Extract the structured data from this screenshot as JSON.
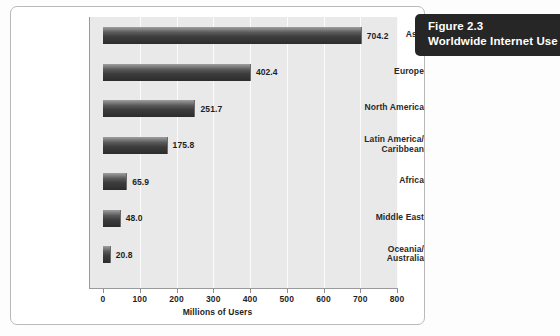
{
  "figure": {
    "number_label": "Figure 2.3",
    "title": "Worldwide Internet Use",
    "badge_color": "#262626"
  },
  "chart_data": {
    "type": "bar",
    "orientation": "horizontal",
    "title": "Worldwide Internet Use",
    "subtitle": "Figure 2.3",
    "xlabel": "Millions of Users",
    "ylabel": "",
    "xlim": [
      0,
      800
    ],
    "xticks": [
      0,
      100,
      200,
      300,
      400,
      500,
      600,
      700,
      800
    ],
    "xtick_labels": [
      "0",
      "100",
      "200",
      "300",
      "400",
      "500",
      "600",
      "700",
      "800"
    ],
    "grid": true,
    "grid_axis": "x",
    "legend": false,
    "categories": [
      "Asia",
      "Europe",
      "North America",
      "Latin America/Caribbean",
      "Africa",
      "Middle East",
      "Oceania/Australia"
    ],
    "category_lines": [
      [
        "Asia"
      ],
      [
        "Europe"
      ],
      [
        "North America"
      ],
      [
        "Latin America/",
        "Caribbean"
      ],
      [
        "Africa"
      ],
      [
        "Middle East"
      ],
      [
        "Oceania/",
        "Australia"
      ]
    ],
    "values": [
      704.2,
      402.4,
      251.7,
      175.8,
      65.9,
      48.0,
      20.8
    ],
    "value_labels": [
      "704.2",
      "402.4",
      "251.7",
      "175.8",
      "65.9",
      "48.0",
      "20.8"
    ],
    "bar_color": "#3c3c3c",
    "plot_background": "#e9e9e9"
  }
}
